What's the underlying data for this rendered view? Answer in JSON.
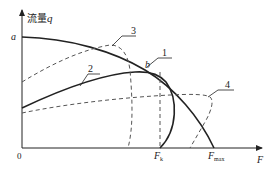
{
  "diagram": {
    "y_axis": {
      "label_cn": "流量",
      "label_var": "q"
    },
    "x_axis": {
      "label": "F"
    },
    "origin_label": "0",
    "point_labels": {
      "a": "a",
      "b": "b"
    },
    "x_ticks": {
      "Fk_main": "F",
      "Fk_sub": "k",
      "Fmax_main": "F",
      "Fmax_sub": "max"
    },
    "curve_labels": [
      "1",
      "2",
      "3",
      "4"
    ],
    "curves": [
      {
        "id": "1",
        "style": "solid",
        "description": "from a descending through b to Fmax"
      },
      {
        "id": "2",
        "style": "solid",
        "description": "rising from q-axis to peak near b then turning down to Fk"
      },
      {
        "id": "3",
        "style": "dashed",
        "description": "rising dashed curve then dropping to F axis left of Fk"
      },
      {
        "id": "4",
        "style": "dashed",
        "description": "low flat dashed curve then dropping to F axis right of Fk"
      }
    ],
    "colors": {
      "line": "#222222",
      "dashed": "#555555"
    }
  }
}
